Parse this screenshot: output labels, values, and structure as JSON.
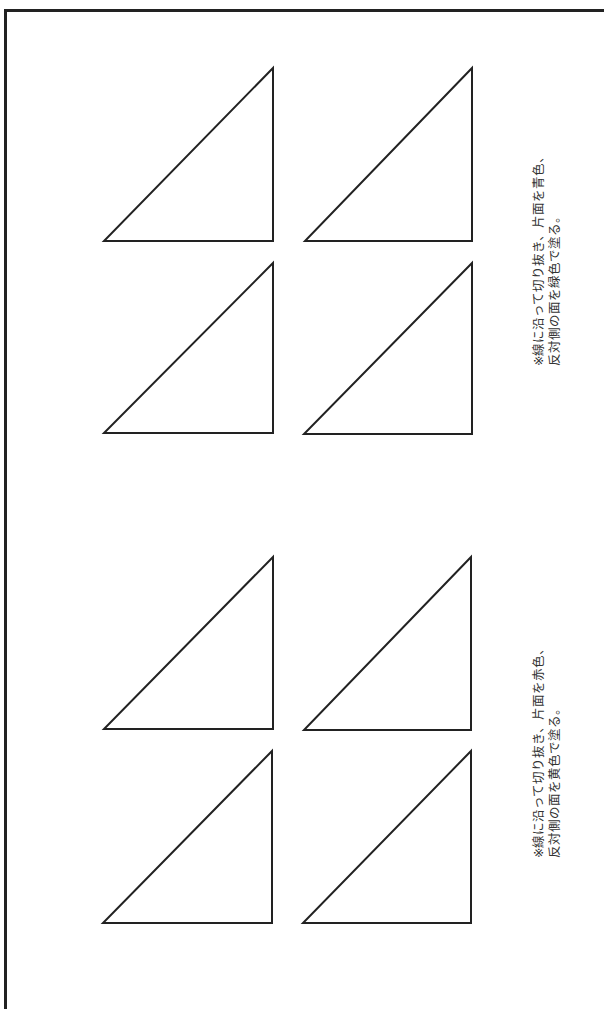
{
  "page": {
    "border_color": "#222222",
    "stroke_color": "#222222",
    "background": "#ffffff"
  },
  "groups": [
    {
      "name": "upper-group",
      "note": {
        "line1": "※線に沿って切り抜き、片面を青色、",
        "line2": "反対側の面を緑色で塗る。"
      },
      "triangles": [
        {
          "top": [
            273,
            68
          ],
          "bl": [
            104,
            241
          ],
          "br": [
            273,
            241
          ]
        },
        {
          "top": [
            472,
            68
          ],
          "bl": [
            305,
            241
          ],
          "br": [
            472,
            241
          ]
        },
        {
          "top": [
            273,
            263
          ],
          "bl": [
            104,
            433
          ],
          "br": [
            273,
            433
          ]
        },
        {
          "top": [
            472,
            263
          ],
          "bl": [
            304,
            434
          ],
          "br": [
            472,
            434
          ]
        }
      ]
    },
    {
      "name": "lower-group",
      "note": {
        "line1": "※線に沿って切り抜き、片面を赤色、",
        "line2": "反対側の面を黄色で塗る。"
      },
      "triangles": [
        {
          "top": [
            273,
            557
          ],
          "bl": [
            104,
            729
          ],
          "br": [
            273,
            729
          ]
        },
        {
          "top": [
            471,
            557
          ],
          "bl": [
            304,
            730
          ],
          "br": [
            471,
            730
          ]
        },
        {
          "top": [
            272,
            751
          ],
          "bl": [
            103,
            923
          ],
          "br": [
            272,
            923
          ]
        },
        {
          "top": [
            471,
            751
          ],
          "bl": [
            303,
            923
          ],
          "br": [
            471,
            923
          ]
        }
      ]
    }
  ]
}
